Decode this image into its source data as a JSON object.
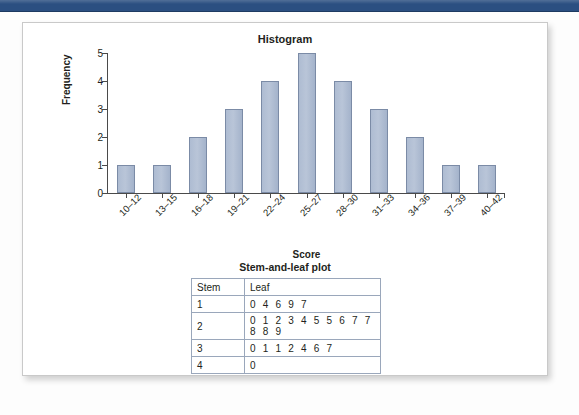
{
  "topbar": {
    "color": "#2b4f81"
  },
  "card": {
    "chart_title": "Histogram",
    "stem_leaf_title": "Stem-and-leaf plot"
  },
  "chart_data": {
    "type": "bar",
    "title": "Histogram",
    "xlabel": "Score",
    "ylabel": "Frequency",
    "categories": [
      "10–12",
      "13–15",
      "16–18",
      "19–21",
      "22–24",
      "25–27",
      "28–30",
      "31–33",
      "34–36",
      "37–39",
      "40–42"
    ],
    "values": [
      1,
      1,
      2,
      3,
      4,
      5,
      4,
      3,
      2,
      1,
      1
    ],
    "ylim": [
      0,
      5
    ],
    "yticks": [
      0,
      1,
      2,
      3,
      4,
      5
    ],
    "grid": false,
    "legend": false,
    "bar_color": "#aebcd2",
    "bar_border_color": "#7b8ba6"
  },
  "stem_leaf": {
    "title": "Stem-and-leaf plot",
    "headers": [
      "Stem",
      "Leaf"
    ],
    "rows": [
      {
        "stem": "1",
        "leaf": "0 4 6 9 7"
      },
      {
        "stem": "2",
        "leaf": "0 1 2 3 4 5 5 6 7 7 8 8 9"
      },
      {
        "stem": "3",
        "leaf": "0 1 1 2 4 6 7"
      },
      {
        "stem": "4",
        "leaf": "0"
      }
    ]
  }
}
